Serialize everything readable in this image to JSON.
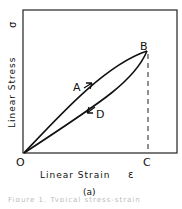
{
  "diagram": {
    "type": "stress-strain hysteresis loop",
    "y_axis_label": "Linear Stress",
    "y_axis_symbol": "σ",
    "x_axis_label": "Linear Strain",
    "x_axis_symbol": "ε",
    "points": {
      "origin": "O",
      "loading": "A",
      "peak": "B",
      "strain_at_peak": "C",
      "unloading": "D"
    },
    "subfigure_label": "(a)",
    "caption_partial": "Figure 1. Typical stress-strain"
  }
}
